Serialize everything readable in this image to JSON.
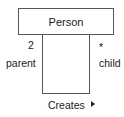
{
  "diagram": {
    "type": "uml-class-reflexive-association",
    "class": {
      "name": "Person"
    },
    "association": {
      "name": "Creates",
      "direction_indicator": "right-triangle",
      "ends": [
        {
          "role": "parent",
          "multiplicity": "2",
          "side": "left"
        },
        {
          "role": "child",
          "multiplicity": "*",
          "side": "right"
        }
      ]
    },
    "colors": {
      "line": "#555555",
      "text": "#1a1a1a",
      "background": "#ffffff"
    }
  }
}
